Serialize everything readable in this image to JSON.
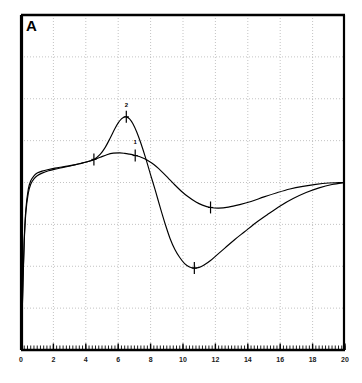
{
  "figure": {
    "panel_label": "A",
    "background_color": "#ffffff",
    "frame_color": "#000000",
    "grid_color": "#b4b4b4"
  },
  "chart_data": {
    "type": "line",
    "title": "A",
    "xlabel": "",
    "ylabel": "",
    "xlim": [
      0,
      20
    ],
    "ylim": [
      0,
      1
    ],
    "grid": true,
    "grid_style": "dotted",
    "legend_position": "none",
    "xticks": [
      0,
      2,
      4,
      6,
      8,
      10,
      12,
      14,
      16,
      18,
      20
    ],
    "xtick_labels": [
      "0",
      "2",
      "4",
      "6",
      "8",
      "10",
      "12",
      "14",
      "16",
      "18",
      "20"
    ],
    "yticks": [],
    "ytick_labels": [],
    "minor_xticks": true,
    "series": [
      {
        "name": "2",
        "label": "2",
        "color": "#000000",
        "annotation": "2",
        "annotation_x": 6.5,
        "annotation_y": 0.695,
        "x": [
          0.05,
          0.12,
          0.2,
          0.3,
          0.45,
          0.6,
          0.8,
          1.0,
          1.3,
          1.7,
          2.1,
          2.6,
          3.1,
          3.6,
          4.1,
          4.5,
          4.9,
          5.2,
          5.5,
          5.8,
          6.0,
          6.2,
          6.35,
          6.5,
          6.7,
          6.9,
          7.15,
          7.4,
          7.7,
          8.0,
          8.3,
          8.6,
          8.9,
          9.2,
          9.5,
          9.8,
          10.1,
          10.4,
          10.7,
          11.0,
          11.3,
          11.7,
          12.1,
          12.6,
          13.2,
          13.8,
          14.5,
          15.2,
          16.0,
          16.8,
          17.6,
          18.4,
          19.2,
          20.0
        ],
        "y": [
          0.06,
          0.2,
          0.33,
          0.42,
          0.48,
          0.505,
          0.52,
          0.528,
          0.534,
          0.539,
          0.543,
          0.547,
          0.551,
          0.556,
          0.562,
          0.569,
          0.585,
          0.605,
          0.632,
          0.661,
          0.678,
          0.69,
          0.695,
          0.696,
          0.69,
          0.676,
          0.65,
          0.617,
          0.572,
          0.523,
          0.475,
          0.424,
          0.376,
          0.333,
          0.3,
          0.276,
          0.258,
          0.248,
          0.2445,
          0.2465,
          0.2535,
          0.267,
          0.284,
          0.305,
          0.33,
          0.353,
          0.38,
          0.404,
          0.43,
          0.452,
          0.47,
          0.484,
          0.494,
          0.5
        ]
      },
      {
        "name": "1",
        "label": "1",
        "color": "#000000",
        "annotation": "1",
        "annotation_x": 7.05,
        "annotation_y": 0.585,
        "x": [
          0.05,
          0.12,
          0.2,
          0.3,
          0.45,
          0.6,
          0.8,
          1.0,
          1.3,
          1.7,
          2.1,
          2.6,
          3.1,
          3.6,
          4.1,
          4.5,
          4.9,
          5.3,
          5.7,
          6.1,
          6.4,
          6.7,
          7.0,
          7.3,
          7.6,
          7.9,
          8.2,
          8.5,
          8.8,
          9.1,
          9.5,
          9.9,
          10.3,
          10.8,
          11.2,
          11.7,
          12.2,
          12.8,
          13.5,
          14.2,
          15.0,
          15.8,
          16.6,
          17.4,
          18.2,
          19.0,
          19.6,
          20.0
        ],
        "y": [
          0.06,
          0.2,
          0.325,
          0.41,
          0.468,
          0.495,
          0.511,
          0.52,
          0.528,
          0.535,
          0.54,
          0.545,
          0.55,
          0.556,
          0.562,
          0.568,
          0.5755,
          0.583,
          0.5875,
          0.5885,
          0.587,
          0.5845,
          0.5815,
          0.5775,
          0.5715,
          0.5635,
          0.5535,
          0.5415,
          0.5275,
          0.5125,
          0.4925,
          0.474,
          0.458,
          0.4415,
          0.4325,
          0.4255,
          0.4235,
          0.4265,
          0.434,
          0.4435,
          0.457,
          0.4695,
          0.4805,
          0.4885,
          0.4945,
          0.4985,
          0.4995,
          0.5
        ]
      }
    ],
    "markers": [
      {
        "series": "2",
        "x": 4.5,
        "y": 0.569,
        "type": "vertical-tick"
      },
      {
        "series": "2",
        "x": 6.5,
        "y": 0.696,
        "type": "vertical-tick"
      },
      {
        "series": "2",
        "x": 10.7,
        "y": 0.2445,
        "type": "vertical-tick"
      },
      {
        "series": "1",
        "x": 7.05,
        "y": 0.5805,
        "type": "vertical-tick"
      },
      {
        "series": "1",
        "x": 11.7,
        "y": 0.4255,
        "type": "vertical-tick"
      }
    ]
  }
}
